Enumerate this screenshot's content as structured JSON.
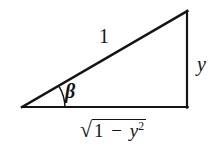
{
  "figure": {
    "type": "right-triangle-trigonometry-diagram",
    "background_color": "#ffffff",
    "stroke_color": "#141414",
    "labels": {
      "hypotenuse": "1",
      "opposite_side": "y",
      "angle": "β",
      "adjacent_radical_sign": "√",
      "adjacent_radicand_one": "1",
      "adjacent_radicand_minus": "−",
      "adjacent_radicand_variable": "y",
      "adjacent_radicand_exponent": "2"
    },
    "geometry": {
      "left_vertex": [
        22,
        107
      ],
      "bottom_right_vertex": [
        187,
        107
      ],
      "top_right_vertex": [
        187,
        11
      ],
      "angle_arc_radius": 43,
      "line_width": 2
    }
  }
}
